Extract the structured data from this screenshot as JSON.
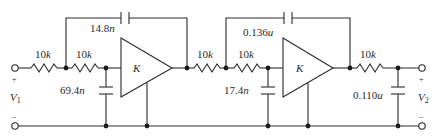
{
  "diagram": {
    "type": "circuit-schematic",
    "input": {
      "label_main": "V",
      "label_sub": "1",
      "plus": "+",
      "minus": "–"
    },
    "output": {
      "label_main": "V",
      "label_sub": "2",
      "plus": "+",
      "minus": "–"
    },
    "stage1": {
      "r1": {
        "value": "10",
        "unit": "k"
      },
      "r2": {
        "value": "10",
        "unit": "k"
      },
      "c_feedback": {
        "value": "14.8",
        "unit": "n"
      },
      "c_shunt": {
        "value": "69.4",
        "unit": "n"
      },
      "amp_gain": "K"
    },
    "stage2": {
      "r1": {
        "value": "10",
        "unit": "k"
      },
      "r2": {
        "value": "10",
        "unit": "k"
      },
      "c_feedback": {
        "value": "0.136",
        "unit": "u"
      },
      "c_shunt": {
        "value": "17.4",
        "unit": "n"
      },
      "amp_gain": "K"
    },
    "output_section": {
      "r": {
        "value": "10",
        "unit": "k"
      },
      "c_shunt": {
        "value": "0.110",
        "unit": "u"
      }
    },
    "colors": {
      "wire": "#2b2b2b",
      "background": "#ffffff"
    }
  }
}
